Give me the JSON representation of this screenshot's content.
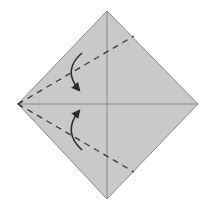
{
  "diagram": {
    "type": "origami-fold-step",
    "width": 209,
    "height": 216,
    "colors": {
      "background": "#ffffff",
      "paper_fill": "#c9c9c9",
      "paper_edge": "#8a8a8a",
      "crease": "#8a8a8a",
      "valley_fold": "#3a3a3a",
      "arrow": "#2a2a2a"
    },
    "paper": {
      "shape": "square-on-point",
      "vertices": {
        "top": [
          107,
          11
        ],
        "right": [
          198,
          104
        ],
        "bottom": [
          107,
          199
        ],
        "left": [
          18,
          104
        ]
      }
    },
    "creases": [
      {
        "name": "vertical-diagonal",
        "from": [
          107,
          11
        ],
        "to": [
          107,
          199
        ]
      },
      {
        "name": "horizontal-diagonal",
        "from": [
          18,
          104
        ],
        "to": [
          198,
          104
        ]
      }
    ],
    "valley_folds": [
      {
        "name": "upper-fold-line",
        "from": [
          18,
          104
        ],
        "to": [
          134,
          36
        ]
      },
      {
        "name": "lower-fold-line",
        "from": [
          18,
          104
        ],
        "to": [
          134,
          172
        ]
      }
    ],
    "arrows": [
      {
        "name": "upper-fold-arrow",
        "direction": "down",
        "path": "M82,53 Q62,70 79,90"
      },
      {
        "name": "lower-fold-arrow",
        "direction": "up",
        "path": "M82,150 Q62,132 79,111"
      }
    ]
  }
}
